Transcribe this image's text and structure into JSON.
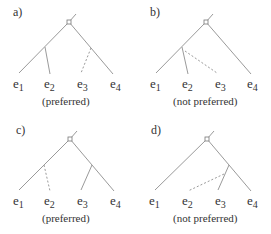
{
  "panels": [
    {
      "id": "a",
      "label": "a)",
      "caption": "(preferred)",
      "leaves": [
        "e",
        "e",
        "e",
        "e"
      ],
      "subs": [
        "1",
        "2",
        "3",
        "4"
      ],
      "dashed_leaf": "e3",
      "attach": "right-branch"
    },
    {
      "id": "b",
      "label": "b)",
      "caption": "(not preferred)",
      "leaves": [
        "e",
        "e",
        "e",
        "e"
      ],
      "subs": [
        "1",
        "2",
        "3",
        "4"
      ],
      "dashed_leaf": "e3",
      "attach": "left-branch"
    },
    {
      "id": "c",
      "label": "c)",
      "caption": "(preferred)",
      "leaves": [
        "e",
        "e",
        "e",
        "e"
      ],
      "subs": [
        "1",
        "2",
        "3",
        "4"
      ],
      "dashed_leaf": "e2",
      "attach": "left-branch"
    },
    {
      "id": "d",
      "label": "d)",
      "caption": "(not preferred)",
      "leaves": [
        "e",
        "e",
        "e",
        "e"
      ],
      "subs": [
        "1",
        "2",
        "3",
        "4"
      ],
      "dashed_leaf": "e2",
      "attach": "right-branch"
    }
  ],
  "colors": {
    "line": "#9a9a9a",
    "text": "#333333"
  }
}
